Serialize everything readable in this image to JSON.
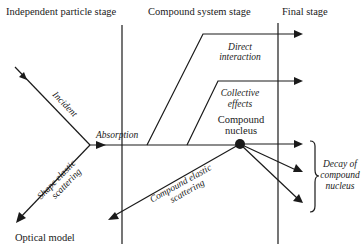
{
  "headers": {
    "independent": "Independent particle stage",
    "compound_system": "Compound system stage",
    "final": "Final stage"
  },
  "labels": {
    "incident": "Incident",
    "absorption": "Absorption",
    "shape_elastic_1": "Shape elastic",
    "shape_elastic_2": "scattering",
    "optical_model": "Optical model",
    "direct_1": "Direct",
    "direct_2": "interaction",
    "collective_1": "Collective",
    "collective_2": "effects",
    "compound_nucleus_1": "Compound",
    "compound_nucleus_2": "nucleus",
    "compound_elastic_1": "Compound elastic",
    "compound_elastic_2": "scattering",
    "decay_1": "Decay of",
    "decay_2": "compound",
    "decay_3": "nucleus"
  },
  "colors": {
    "ink": "#1a1a1a",
    "background": "#ffffff"
  }
}
